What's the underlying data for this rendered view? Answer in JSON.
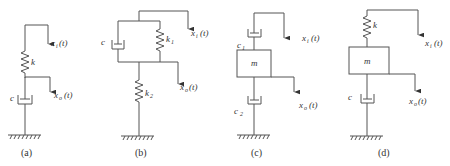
{
  "figure": {
    "panels": [
      {
        "id": "a",
        "caption": "(a)",
        "elements": [
          "spring k",
          "damper c",
          "ground"
        ],
        "labels": {
          "spring": "k",
          "damper": "c",
          "input_var": "x",
          "input_sub": "i",
          "input_arg": "(t)",
          "output_var": "x",
          "output_sub": "o",
          "output_arg": "(t)"
        }
      },
      {
        "id": "b",
        "caption": "(b)",
        "elements": [
          "damper c parallel with spring k1",
          "spring k2 in series",
          "ground"
        ],
        "labels": {
          "damper": "c",
          "spring1": "k",
          "spring1_sub": "1",
          "spring2": "k",
          "spring2_sub": "2",
          "input_var": "x",
          "input_sub": "i",
          "input_arg": "(t)",
          "output_var": "x",
          "output_sub": "o",
          "output_arg": "(t)"
        }
      },
      {
        "id": "c",
        "caption": "(c)",
        "elements": [
          "damper c1",
          "mass m",
          "damper c2",
          "ground"
        ],
        "labels": {
          "damper1": "c",
          "damper1_sub": "1",
          "mass": "m",
          "damper2": "c",
          "damper2_sub": "2",
          "input_var": "x",
          "input_sub": "i",
          "input_arg": "(t)",
          "output_var": "x",
          "output_sub": "o",
          "output_arg": "(t)"
        }
      },
      {
        "id": "d",
        "caption": "(d)",
        "elements": [
          "spring k",
          "mass m",
          "damper c",
          "ground"
        ],
        "labels": {
          "spring": "k",
          "mass": "m",
          "damper": "c",
          "input_var": "x",
          "input_sub": "i",
          "input_arg": "(t)",
          "output_var": "x",
          "output_sub": "o",
          "output_arg": "(t)"
        }
      }
    ],
    "colors": {
      "line": "#555555",
      "text": "#333333",
      "background": "#ffffff"
    }
  }
}
